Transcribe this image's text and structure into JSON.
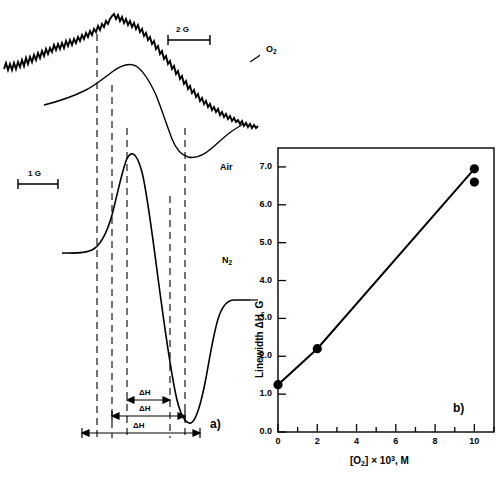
{
  "figure": {
    "panel_a": {
      "label": "a)",
      "trace_labels": [
        {
          "name": "O2",
          "text": "O₂",
          "x": 266,
          "y": 50
        },
        {
          "name": "Air",
          "text": "Air",
          "x": 220,
          "y": 168
        },
        {
          "name": "N2",
          "text": "N₂",
          "x": 222,
          "y": 258
        }
      ],
      "scale_bars": [
        {
          "name": "2G",
          "label": "2 G",
          "x": 168,
          "y": 24,
          "width": 42
        },
        {
          "name": "1G",
          "label": "1 G",
          "x": 18,
          "y": 168,
          "width": 40
        }
      ],
      "linewidth_markers": [
        {
          "label": "ΔH",
          "x1": 127,
          "x2": 170,
          "y": 400
        },
        {
          "label": "ΔH",
          "x1": 112,
          "x2": 185,
          "y": 416
        },
        {
          "label": "ΔH",
          "x1": 82,
          "x2": 200,
          "y": 433
        }
      ],
      "dashed_guides": [
        97,
        112,
        127,
        170,
        185
      ]
    },
    "panel_b": {
      "label": "b)"
    }
  },
  "chart_data": {
    "type": "scatter",
    "title": "",
    "xlabel": "[O₂] × 10³, M",
    "ylabel": "Linewidth ΔH, G",
    "xlim": [
      0,
      11
    ],
    "ylim": [
      0.0,
      7.5
    ],
    "xticks": [
      0,
      2,
      4,
      6,
      8,
      10
    ],
    "xtick_labels": [
      "0",
      "2",
      "4",
      "6",
      "8",
      "10"
    ],
    "xminor_ticks": [
      1,
      3,
      5,
      7,
      9,
      11
    ],
    "yticks": [
      0.0,
      1.0,
      2.0,
      3.0,
      4.0,
      5.0,
      6.0,
      7.0
    ],
    "ytick_labels": [
      "0.0",
      "1.0",
      "2.0",
      "3.0",
      "4.0",
      "5.0",
      "6.0",
      "7.0"
    ],
    "grid": false,
    "legend": "none",
    "series": [
      {
        "name": "Linewidth vs oxygen concentration",
        "marker": "filled-circle",
        "line": true,
        "points": [
          {
            "x": 0.0,
            "y": 1.25
          },
          {
            "x": 2.0,
            "y": 2.2
          },
          {
            "x": 10.0,
            "y": 6.6
          },
          {
            "x": 10.0,
            "y": 6.95
          }
        ]
      }
    ],
    "line_path": [
      {
        "x": 0.0,
        "y": 1.25
      },
      {
        "x": 2.0,
        "y": 2.2
      },
      {
        "x": 10.0,
        "y": 6.95
      }
    ]
  }
}
